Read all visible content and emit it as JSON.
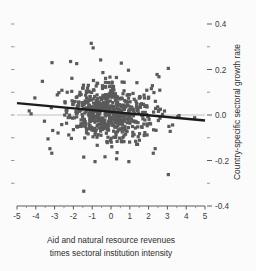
{
  "chart_data": {
    "type": "scatter",
    "title": "",
    "xlabel": "Aid and natural resource revenues times sectoral institution intensity",
    "xlabel_line1": "Aid and natural resource revenues",
    "xlabel_line2": "times sectoral institution intensity",
    "ylabel": "Country-specific sectoral growth rate",
    "xlim": [
      -5,
      5
    ],
    "ylim": [
      -0.4,
      0.4
    ],
    "grid": false,
    "legend": null,
    "x_ticks": [
      -5,
      -4,
      -3,
      -2,
      -1,
      0,
      1,
      2,
      3,
      4,
      5
    ],
    "x_tick_labels": [
      "-5",
      "-4",
      "-3",
      "-2",
      "-1",
      "0",
      "1",
      "2",
      "3",
      "4",
      "5"
    ],
    "x_minor_ticks": [
      -4.5,
      -3.5,
      -2.5,
      -1.5,
      -0.5,
      0.5,
      1.5,
      2.5,
      3.5,
      4.5
    ],
    "y_ticks": [
      -0.4,
      -0.2,
      0.0,
      0.2,
      0.4
    ],
    "y_tick_labels": [
      "-0.4",
      "-0.2",
      "0.0",
      "0.2",
      "0.4"
    ],
    "y_minor_ticks": [
      -0.3,
      -0.1,
      0.1,
      0.3
    ],
    "y_axis_position": "right",
    "left_axis_ticks_unlabeled": true,
    "marker": {
      "shape": "square",
      "size_px": 3.2,
      "color": "#5a5a5a"
    },
    "reference_line": {
      "type": "horizontal",
      "y": 0.0,
      "color": "#b9b9b9",
      "width_px": 0.9
    },
    "fit_line": {
      "type": "linear",
      "label": "linear fit",
      "x_start": -5,
      "y_start": 0.052,
      "x_end": 5,
      "y_end": -0.024,
      "slope": -0.0076,
      "intercept": 0.014,
      "color": "#1c1c1c",
      "width_px": 2.4
    },
    "n_points": 640,
    "point_distribution": {
      "note": "dense central cluster, bivariate, slight negative correlation",
      "x_mean": -0.1,
      "x_sd": 1.15,
      "y_mean": 0.012,
      "y_sd": 0.062,
      "correlation": -0.09,
      "seed": 20250411
    },
    "outliers": [
      {
        "x": -1.05,
        "y": 0.315
      },
      {
        "x": -0.95,
        "y": 0.295
      },
      {
        "x": -2.15,
        "y": 0.235
      },
      {
        "x": -0.55,
        "y": 0.242
      },
      {
        "x": 0.55,
        "y": 0.228
      },
      {
        "x": 3.05,
        "y": 0.205
      },
      {
        "x": 2.45,
        "y": 0.178
      },
      {
        "x": 2.55,
        "y": 0.168
      },
      {
        "x": -3.65,
        "y": 0.148
      },
      {
        "x": -4.05,
        "y": 0.075
      },
      {
        "x": -4.35,
        "y": 0.018
      },
      {
        "x": -4.25,
        "y": 0.005
      },
      {
        "x": 4.45,
        "y": -0.012
      },
      {
        "x": 3.55,
        "y": -0.008
      },
      {
        "x": 3.15,
        "y": -0.072
      },
      {
        "x": -3.35,
        "y": -0.105
      },
      {
        "x": -3.25,
        "y": -0.148
      },
      {
        "x": -3.15,
        "y": -0.168
      },
      {
        "x": -1.45,
        "y": -0.185
      },
      {
        "x": -0.85,
        "y": -0.205
      },
      {
        "x": 0.95,
        "y": -0.205
      },
      {
        "x": 3.05,
        "y": -0.262
      },
      {
        "x": -1.45,
        "y": -0.335
      },
      {
        "x": 2.25,
        "y": -0.168
      },
      {
        "x": 2.35,
        "y": -0.148
      }
    ]
  },
  "axis_labels": {
    "x_line1": "Aid and natural resource revenues",
    "x_line2": "times sectoral institution intensity",
    "y_title": "Country-specific sectoral growth rate"
  },
  "colors": {
    "background": "#fbfbfb",
    "marker": "#5a5a5a",
    "fit_line": "#1c1c1c",
    "reference_line": "#b9b9b9",
    "axis": "#4a4a4a",
    "text": "#2e2e2e"
  }
}
